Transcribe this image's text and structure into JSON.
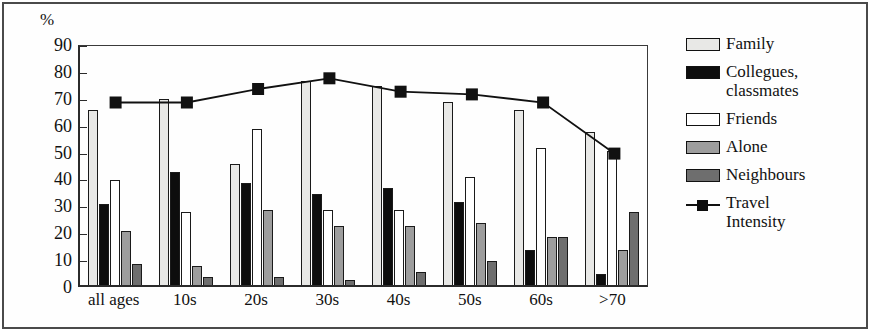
{
  "chart_data": {
    "type": "bar",
    "title": "",
    "xlabel": "",
    "ylabel": "%",
    "ylim": [
      0,
      90
    ],
    "yticks": [
      0,
      10,
      20,
      30,
      40,
      50,
      60,
      70,
      80,
      90
    ],
    "grid": false,
    "legend_position": "right",
    "categories": [
      "all ages",
      "10s",
      "20s",
      "30s",
      "40s",
      "50s",
      "60s",
      ">70"
    ],
    "series": [
      {
        "name": "Family",
        "type": "bar",
        "color": "#e8e8e6",
        "values": [
          65,
          69,
          45,
          76,
          74,
          68,
          65,
          57
        ]
      },
      {
        "name": "Collegues, classmates",
        "type": "bar",
        "color": "#0d0d0d",
        "values": [
          30,
          42,
          38,
          34,
          36,
          31,
          13,
          4
        ]
      },
      {
        "name": "Friends",
        "type": "bar",
        "color": "#ffffff",
        "values": [
          39,
          27,
          58,
          28,
          28,
          40,
          51,
          50
        ]
      },
      {
        "name": "Alone",
        "type": "bar",
        "color": "#9d9d9d",
        "values": [
          20,
          7,
          28,
          22,
          22,
          23,
          18,
          13
        ]
      },
      {
        "name": "Neighbours",
        "type": "bar",
        "color": "#6e6e6e",
        "values": [
          8,
          3,
          3,
          2,
          5,
          9,
          18,
          27
        ]
      },
      {
        "name": "Travel Intensity",
        "type": "line",
        "color": "#111111",
        "marker": "square",
        "values": [
          69,
          69,
          74,
          78,
          73,
          72,
          69,
          50
        ]
      }
    ]
  },
  "axis": {
    "unit_label": "%",
    "ytick_labels": [
      "90",
      "80",
      "70",
      "60",
      "50",
      "40",
      "30",
      "20",
      "10",
      "0"
    ],
    "xtick_labels": [
      "all ages",
      "10s",
      "20s",
      "30s",
      "40s",
      "50s",
      "60s",
      ">70"
    ]
  },
  "legend": {
    "items": [
      {
        "label": "Family",
        "label2": "",
        "kind": "swatch",
        "color": "#e8e8e6"
      },
      {
        "label": "Collegues,",
        "label2": "classmates",
        "kind": "swatch",
        "color": "#0d0d0d"
      },
      {
        "label": "Friends",
        "label2": "",
        "kind": "swatch",
        "color": "#ffffff"
      },
      {
        "label": "Alone",
        "label2": "",
        "kind": "swatch",
        "color": "#9d9d9d"
      },
      {
        "label": "Neighbours",
        "label2": "",
        "kind": "swatch",
        "color": "#6e6e6e"
      },
      {
        "label": "Travel",
        "label2": "Intensity",
        "kind": "line",
        "color": "#111111"
      }
    ]
  }
}
